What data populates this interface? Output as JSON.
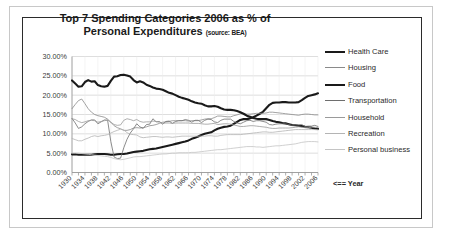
{
  "chart_data": {
    "type": "line",
    "title": "Top 7 Spending Categories 2006 as % of Personal Expenditures",
    "subtitle": "(source: BEA)",
    "source": "BEA",
    "xlabel": "<== Year",
    "ylabel": "",
    "xlim": [
      1930,
      2006
    ],
    "ylim": [
      0,
      30
    ],
    "ytick_labels": [
      "30.00%",
      "25.00%",
      "20.00%",
      "15.00%",
      "10.00%",
      "5.00%",
      "0.00%"
    ],
    "ytick_values": [
      30,
      25,
      20,
      15,
      10,
      5,
      0
    ],
    "xtick_labels": [
      "1930",
      "1934",
      "1938",
      "1942",
      "1946",
      "1950",
      "1954",
      "1958",
      "1962",
      "1966",
      "1970",
      "1974",
      "1978",
      "1982",
      "1986",
      "1990",
      "1994",
      "1998",
      "2002",
      "2006"
    ],
    "xtick_values": [
      1930,
      1934,
      1938,
      1942,
      1946,
      1950,
      1954,
      1958,
      1962,
      1966,
      1970,
      1974,
      1978,
      1982,
      1986,
      1990,
      1994,
      1998,
      2002,
      2006
    ],
    "grid": true,
    "grid_axis": "y",
    "legend_position": "right",
    "x": [
      1930,
      1931,
      1932,
      1933,
      1934,
      1935,
      1936,
      1937,
      1938,
      1939,
      1940,
      1941,
      1942,
      1943,
      1944,
      1945,
      1946,
      1947,
      1948,
      1949,
      1950,
      1951,
      1952,
      1953,
      1954,
      1955,
      1956,
      1957,
      1958,
      1959,
      1960,
      1961,
      1962,
      1963,
      1964,
      1965,
      1966,
      1967,
      1968,
      1969,
      1970,
      1971,
      1972,
      1973,
      1974,
      1975,
      1976,
      1977,
      1978,
      1979,
      1980,
      1981,
      1982,
      1983,
      1984,
      1985,
      1986,
      1987,
      1988,
      1989,
      1990,
      1991,
      1992,
      1993,
      1994,
      1995,
      1996,
      1997,
      1998,
      1999,
      2000,
      2001,
      2002,
      2003,
      2004,
      2005,
      2006
    ],
    "series": [
      {
        "name": "Health Care",
        "color": "#1a1a1a",
        "width": 2.1,
        "values": [
          4.7,
          4.7,
          4.6,
          4.6,
          4.6,
          4.6,
          4.6,
          4.7,
          4.8,
          4.8,
          4.8,
          4.7,
          4.6,
          4.6,
          4.7,
          4.8,
          4.8,
          4.9,
          5.1,
          5.3,
          5.4,
          5.5,
          5.6,
          5.8,
          6.0,
          6.1,
          6.2,
          6.4,
          6.6,
          6.8,
          7.0,
          7.2,
          7.4,
          7.6,
          7.8,
          8.0,
          8.3,
          8.7,
          9.0,
          9.3,
          9.7,
          10.0,
          10.2,
          10.4,
          10.9,
          11.3,
          11.6,
          11.8,
          11.9,
          12.1,
          12.6,
          13.1,
          13.6,
          13.8,
          13.8,
          14.0,
          14.3,
          14.7,
          15.2,
          15.7,
          16.6,
          17.5,
          18.0,
          18.1,
          18.1,
          18.2,
          18.2,
          18.1,
          18.1,
          18.1,
          18.2,
          18.7,
          19.3,
          19.8,
          20.0,
          20.2,
          20.5
        ]
      },
      {
        "name": "Housing",
        "color": "#8a8a8a",
        "width": 0.8,
        "values": [
          16.5,
          17.6,
          18.6,
          19.0,
          17.8,
          16.5,
          15.6,
          15.0,
          14.7,
          14.5,
          14.3,
          13.8,
          13.0,
          12.1,
          11.6,
          11.3,
          10.9,
          10.9,
          11.1,
          11.5,
          11.6,
          11.5,
          11.6,
          11.8,
          12.1,
          12.2,
          12.4,
          12.7,
          13.0,
          13.1,
          13.2,
          13.4,
          13.4,
          13.4,
          13.4,
          13.4,
          13.3,
          13.4,
          13.4,
          13.4,
          13.6,
          13.8,
          13.9,
          13.9,
          14.2,
          14.6,
          14.6,
          14.5,
          14.4,
          14.4,
          14.7,
          14.9,
          15.2,
          15.2,
          15.1,
          15.1,
          15.2,
          15.3,
          15.3,
          15.3,
          15.4,
          15.6,
          15.6,
          15.5,
          15.4,
          15.3,
          15.2,
          15.1,
          15.0,
          14.9,
          14.8,
          15.0,
          15.1,
          15.1,
          15.0,
          14.9,
          14.9
        ]
      },
      {
        "name": "Food",
        "color": "#1a1a1a",
        "width": 2.1,
        "values": [
          23.8,
          23.0,
          22.2,
          22.3,
          23.4,
          23.9,
          23.5,
          23.6,
          22.6,
          22.3,
          22.2,
          22.4,
          23.7,
          24.8,
          24.9,
          25.2,
          25.3,
          25.1,
          24.8,
          23.9,
          23.3,
          23.6,
          23.3,
          22.7,
          22.4,
          22.0,
          21.7,
          21.6,
          21.4,
          21.0,
          20.6,
          20.4,
          20.0,
          19.6,
          19.3,
          19.1,
          18.8,
          18.4,
          18.1,
          17.9,
          17.8,
          17.4,
          17.1,
          17.1,
          17.2,
          17.0,
          16.6,
          16.3,
          16.2,
          16.2,
          16.1,
          15.9,
          15.6,
          15.2,
          14.7,
          14.4,
          14.1,
          13.9,
          13.8,
          13.8,
          13.8,
          13.6,
          13.3,
          13.1,
          13.0,
          12.8,
          12.7,
          12.5,
          12.3,
          12.2,
          12.1,
          12.0,
          11.8,
          11.7,
          11.6,
          11.4,
          11.3
        ]
      },
      {
        "name": "Transportation",
        "color": "#6e6e6e",
        "width": 0.8,
        "values": [
          14.0,
          12.8,
          11.4,
          11.8,
          12.6,
          13.2,
          13.6,
          13.6,
          12.6,
          13.1,
          13.6,
          13.5,
          8.0,
          4.0,
          3.6,
          3.7,
          6.4,
          8.6,
          10.2,
          11.3,
          12.6,
          11.8,
          11.4,
          12.4,
          12.5,
          13.9,
          13.1,
          13.2,
          12.5,
          13.2,
          13.3,
          12.7,
          13.2,
          13.4,
          13.4,
          13.7,
          13.5,
          13.0,
          13.5,
          13.5,
          12.9,
          13.5,
          13.8,
          13.7,
          13.1,
          12.9,
          13.5,
          13.8,
          13.8,
          13.8,
          13.2,
          12.8,
          12.6,
          13.0,
          13.4,
          13.5,
          13.2,
          13.4,
          13.4,
          13.2,
          13.0,
          12.4,
          12.3,
          12.5,
          12.6,
          12.6,
          12.6,
          12.4,
          12.2,
          12.3,
          12.3,
          12.4,
          11.9,
          12.0,
          12.0,
          12.2,
          11.9
        ]
      },
      {
        "name": "Household",
        "color": "#9a9a9a",
        "width": 0.8,
        "values": [
          13.9,
          13.7,
          13.2,
          12.9,
          13.1,
          13.4,
          13.5,
          13.4,
          13.0,
          13.2,
          13.4,
          13.6,
          13.0,
          12.4,
          12.2,
          12.3,
          13.5,
          13.9,
          13.7,
          13.4,
          13.7,
          13.2,
          13.0,
          13.1,
          13.1,
          13.3,
          13.2,
          13.0,
          12.7,
          12.8,
          12.8,
          12.7,
          12.8,
          12.8,
          12.8,
          12.8,
          12.8,
          12.7,
          12.7,
          12.7,
          12.6,
          12.5,
          12.5,
          12.6,
          12.7,
          12.4,
          12.5,
          12.6,
          12.6,
          12.5,
          12.3,
          12.1,
          11.9,
          11.9,
          12.0,
          12.1,
          12.1,
          12.0,
          11.9,
          11.8,
          11.7,
          11.5,
          11.4,
          11.4,
          11.5,
          11.5,
          11.5,
          11.5,
          11.6,
          11.7,
          11.8,
          11.7,
          11.6,
          11.6,
          11.7,
          11.7,
          11.6
        ]
      },
      {
        "name": "Recreation",
        "color": "#b4b4b4",
        "width": 0.8,
        "values": [
          8.8,
          8.5,
          8.2,
          8.2,
          8.6,
          8.9,
          9.3,
          9.5,
          9.3,
          9.5,
          9.6,
          9.8,
          10.2,
          10.6,
          10.9,
          11.2,
          11.0,
          10.3,
          9.9,
          9.8,
          9.7,
          9.2,
          9.0,
          9.1,
          9.2,
          9.3,
          9.3,
          9.2,
          9.1,
          9.2,
          9.2,
          9.1,
          9.2,
          9.3,
          9.4,
          9.4,
          9.4,
          9.4,
          9.4,
          9.4,
          9.4,
          9.4,
          9.5,
          9.5,
          9.4,
          9.4,
          9.6,
          9.7,
          9.8,
          9.8,
          9.8,
          9.8,
          9.8,
          9.9,
          10.0,
          10.1,
          10.2,
          10.3,
          10.4,
          10.5,
          10.5,
          10.4,
          10.4,
          10.5,
          10.6,
          10.7,
          10.8,
          10.9,
          11.0,
          11.1,
          11.1,
          11.1,
          11.1,
          11.1,
          11.1,
          11.1,
          11.0
        ]
      },
      {
        "name": "Personal business",
        "color": "#c4c4c4",
        "width": 0.8,
        "values": [
          5.0,
          5.0,
          5.0,
          4.9,
          4.8,
          4.7,
          4.6,
          4.5,
          4.4,
          4.3,
          4.2,
          4.1,
          3.9,
          3.6,
          3.4,
          3.3,
          3.4,
          3.6,
          3.8,
          4.0,
          4.1,
          4.1,
          4.2,
          4.3,
          4.4,
          4.5,
          4.6,
          4.7,
          4.8,
          4.8,
          4.9,
          5.0,
          5.0,
          5.1,
          5.1,
          5.1,
          5.1,
          5.2,
          5.2,
          5.3,
          5.4,
          5.5,
          5.6,
          5.7,
          5.8,
          5.9,
          5.9,
          6.0,
          6.1,
          6.2,
          6.3,
          6.4,
          6.5,
          6.6,
          6.7,
          6.7,
          6.7,
          6.6,
          6.6,
          6.5,
          6.6,
          6.7,
          6.8,
          6.9,
          6.9,
          7.0,
          7.1,
          7.2,
          7.3,
          7.4,
          7.6,
          7.8,
          7.9,
          8.0,
          8.0,
          8.0,
          7.9
        ]
      }
    ]
  },
  "legend": {
    "items": [
      {
        "label": "Health Care"
      },
      {
        "label": "Housing"
      },
      {
        "label": "Food"
      },
      {
        "label": "Transportation"
      },
      {
        "label": "Household"
      },
      {
        "label": "Recreation"
      },
      {
        "label": "Personal business"
      }
    ],
    "year_note": "<== Year"
  },
  "colors": {
    "frame_outer": "#c8c8c8",
    "frame_inner": "#2b2b2b",
    "grid": "#d0d0d0",
    "axis": "#9a9a9a",
    "text": "#2a2a2a"
  }
}
